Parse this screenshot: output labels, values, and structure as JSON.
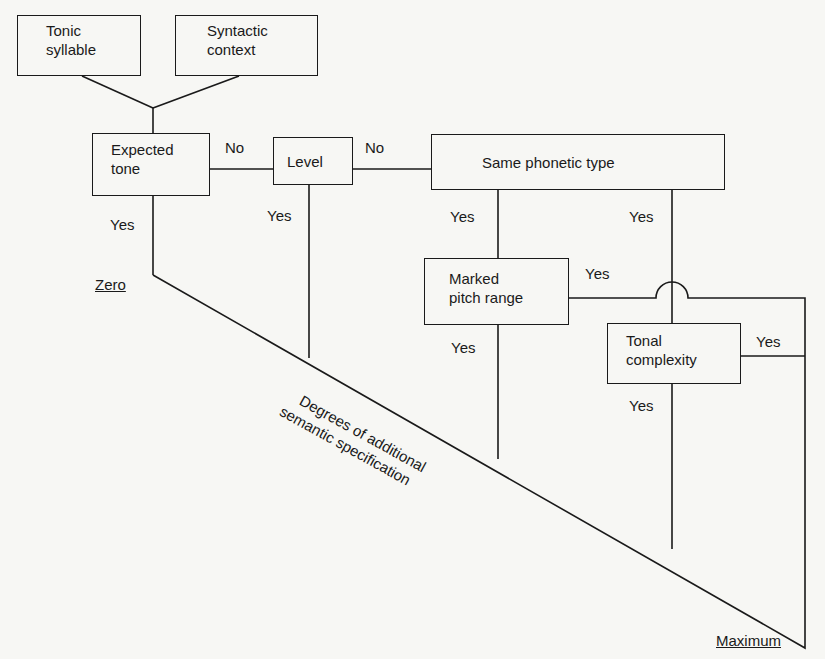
{
  "boxes": {
    "tonic_syllable": {
      "line1": "Tonic",
      "line2": "syllable"
    },
    "syntactic_context": {
      "line1": "Syntactic",
      "line2": "context"
    },
    "expected_tone": {
      "line1": "Expected",
      "line2": "tone"
    },
    "level": {
      "line1": "Level"
    },
    "same_phonetic_type": {
      "line1": "Same phonetic type"
    },
    "marked_pitch_range": {
      "line1": "Marked",
      "line2": "pitch range"
    },
    "tonal_complexity": {
      "line1": "Tonal",
      "line2": "complexity"
    }
  },
  "edges": {
    "expected_to_level": "No",
    "level_to_same": "No",
    "expected_yes": "Yes",
    "level_yes": "Yes",
    "same_yes_left": "Yes",
    "same_yes_right": "Yes",
    "marked_yes_right": "Yes",
    "marked_yes_down": "Yes",
    "tonal_yes_right": "Yes",
    "tonal_yes_down": "Yes"
  },
  "scale": {
    "start": "Zero",
    "end": "Maximum",
    "axis_label_line1": "Degrees of additional",
    "axis_label_line2": "semantic specification"
  }
}
